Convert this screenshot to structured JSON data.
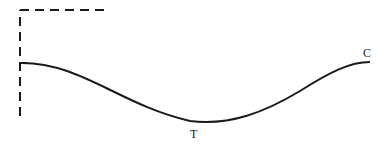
{
  "diagram": {
    "labels": {
      "trough": "T",
      "crest": "C"
    },
    "colors": {
      "stroke": "#1a1a1a",
      "background": "#ffffff"
    }
  }
}
